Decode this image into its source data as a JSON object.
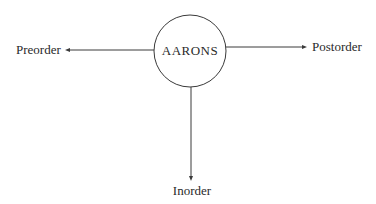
{
  "diagram": {
    "center_node": {
      "label": "AARONS",
      "shape": "circle"
    },
    "branches": [
      {
        "label": "Preorder",
        "direction": "left"
      },
      {
        "label": "Postorder",
        "direction": "right"
      },
      {
        "label": "Inorder",
        "direction": "down"
      }
    ],
    "colors": {
      "stroke": "#3a3a3a",
      "text": "#2a2a2a",
      "background": "#ffffff"
    }
  }
}
